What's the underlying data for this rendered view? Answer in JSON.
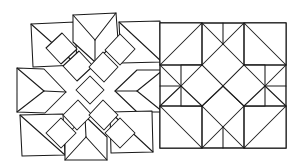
{
  "figure": {
    "background_color": "#ffffff",
    "line_color": "#1a1a1a",
    "fill_color": "#ffffff",
    "width": 295,
    "height": 167,
    "panel_count": 2,
    "style": "hand-drawn line art, no shading, no text labels"
  },
  "panels": [
    {
      "id": "exploded-panel",
      "name": "exploded-block",
      "caption": "",
      "description": "Nine quilt patches shown separated with gaps, arranged in a 3x3 layout around a central pinwheel of rhombi",
      "bounds": {
        "x": 8,
        "y": 10,
        "width": 140,
        "height": 150
      },
      "piece_count": 13,
      "pieces": [
        {
          "name": "corner-square-top-left",
          "shape": "square-with-diagonal",
          "subunits": 2
        },
        {
          "name": "chevron-top-center",
          "shape": "chevron-down",
          "subunits": 2
        },
        {
          "name": "corner-square-top-right",
          "shape": "square-with-diagonal",
          "subunits": 2
        },
        {
          "name": "chevron-middle-left",
          "shape": "chevron-right",
          "subunits": 2
        },
        {
          "name": "chevron-middle-right",
          "shape": "chevron-left",
          "subunits": 2
        },
        {
          "name": "corner-square-bottom-left",
          "shape": "square-with-diagonal",
          "subunits": 2
        },
        {
          "name": "chevron-bottom-center",
          "shape": "chevron-up",
          "subunits": 2
        },
        {
          "name": "corner-square-bottom-right",
          "shape": "square-with-diagonal",
          "subunits": 2
        },
        {
          "name": "center-rhombus-cluster",
          "shape": "x-cross-of-rhombi",
          "subunits": 9
        }
      ]
    },
    {
      "id": "assembled-panel",
      "name": "assembled-block",
      "caption": "",
      "description": "Completed square quilt block with eight-pointed star formed from rhombi, squares and corner triangles",
      "bounds": {
        "x": 160,
        "y": 23,
        "width": 126,
        "height": 125
      },
      "piece_count": 25,
      "pieces": [
        {
          "name": "outer-frame",
          "shape": "square"
        },
        {
          "name": "corner-triangle-nw",
          "shape": "triangle"
        },
        {
          "name": "corner-triangle-ne",
          "shape": "triangle"
        },
        {
          "name": "corner-triangle-sw",
          "shape": "triangle"
        },
        {
          "name": "corner-triangle-se",
          "shape": "triangle"
        },
        {
          "name": "edge-rhombus-group",
          "shape": "rhombus",
          "subunits": 8
        },
        {
          "name": "inner-square-on-point",
          "shape": "square-on-point",
          "subunits": 4
        },
        {
          "name": "center-star",
          "shape": "eight-point-star"
        }
      ]
    }
  ]
}
